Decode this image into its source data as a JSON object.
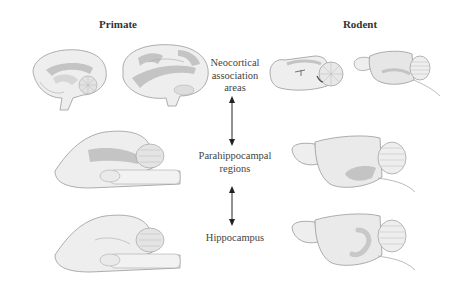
{
  "headers": {
    "left": "Primate",
    "right": "Rodent"
  },
  "levels": [
    {
      "id": "neocortical",
      "lines": [
        "Neocortical",
        "association",
        "areas"
      ]
    },
    {
      "id": "parahippocampal",
      "lines": [
        "Parahippocampal",
        "regions"
      ]
    },
    {
      "id": "hippocampus",
      "lines": [
        "Hippocampus"
      ]
    }
  ],
  "arrows": [
    {
      "from": "neocortical",
      "to": "parahippocampal",
      "direction": "bidirectional"
    },
    {
      "from": "parahippocampal",
      "to": "hippocampus",
      "direction": "bidirectional"
    }
  ],
  "colors": {
    "brain_fill": "#eeeeee",
    "brain_outline": "#9a9a9a",
    "highlight": "#c4c4c4",
    "arrow": "#222222",
    "text": "#444444"
  },
  "illustrations": [
    {
      "species": "primate",
      "level": "neocortical",
      "views": [
        "medial-sagittal",
        "lateral"
      ]
    },
    {
      "species": "rodent",
      "level": "neocortical",
      "views": [
        "medial-sagittal",
        "lateral"
      ]
    },
    {
      "species": "primate",
      "level": "parahippocampal",
      "views": [
        "ventral-medial"
      ]
    },
    {
      "species": "rodent",
      "level": "parahippocampal",
      "views": [
        "lateral"
      ]
    },
    {
      "species": "primate",
      "level": "hippocampus",
      "views": [
        "ventral-medial"
      ]
    },
    {
      "species": "rodent",
      "level": "hippocampus",
      "views": [
        "lateral"
      ]
    }
  ]
}
